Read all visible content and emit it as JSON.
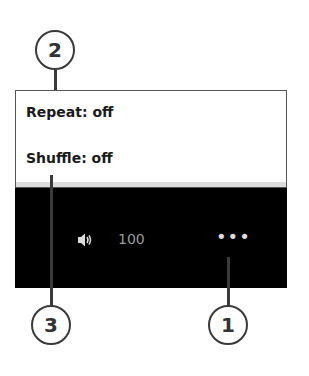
{
  "menu": {
    "items": [
      {
        "label": "Repeat: off"
      },
      {
        "label": "Shuffle: off"
      }
    ]
  },
  "player_bar": {
    "volume_icon": "speaker-icon",
    "volume_value": "100",
    "more_icon": "more-options-icon",
    "more_label": "•••"
  },
  "callouts": [
    {
      "number": "1"
    },
    {
      "number": "2"
    },
    {
      "number": "3"
    }
  ],
  "colors": {
    "bar_bg": "#000000",
    "menu_bg": "#ffffff",
    "volume_text": "#9a9a9a"
  }
}
